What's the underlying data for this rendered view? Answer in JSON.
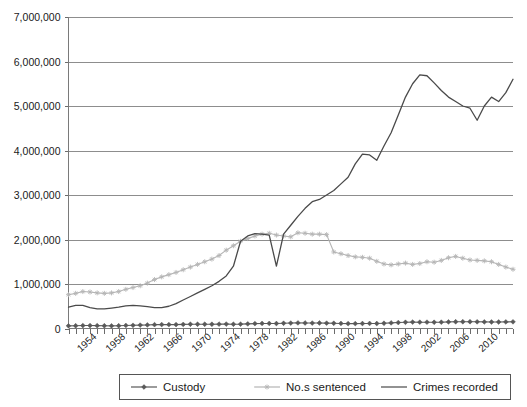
{
  "chart_data": {
    "type": "line",
    "title": "",
    "subtitle": "",
    "xlabel": "",
    "ylabel": "",
    "ylim": [
      0,
      7000000
    ],
    "xlim": [
      1950,
      2012
    ],
    "grid": true,
    "legend_position": "bottom",
    "y_ticks": [
      0,
      1000000,
      2000000,
      3000000,
      4000000,
      5000000,
      6000000,
      7000000
    ],
    "y_tick_labels": [
      "0",
      "1,000,000",
      "2,000,000",
      "3,000,000",
      "4,000,000",
      "5,000,000",
      "6,000,000",
      "7,000,000"
    ],
    "x_tick_labels": [
      "1954",
      "1958",
      "1962",
      "1966",
      "1970",
      "1974",
      "1978",
      "1982",
      "1986",
      "1990",
      "1994",
      "1998",
      "2002",
      "2006",
      "2010"
    ],
    "x_tick_values": [
      1954,
      1958,
      1962,
      1966,
      1970,
      1974,
      1978,
      1982,
      1986,
      1990,
      1994,
      1998,
      2002,
      2006,
      2010
    ],
    "x_minor_step": 1,
    "x": [
      1950,
      1951,
      1952,
      1953,
      1954,
      1955,
      1956,
      1957,
      1958,
      1959,
      1960,
      1961,
      1962,
      1963,
      1964,
      1965,
      1966,
      1967,
      1968,
      1969,
      1970,
      1971,
      1972,
      1973,
      1974,
      1975,
      1976,
      1977,
      1978,
      1979,
      1980,
      1981,
      1982,
      1983,
      1984,
      1985,
      1986,
      1987,
      1988,
      1989,
      1990,
      1991,
      1992,
      1993,
      1994,
      1995,
      1996,
      1997,
      1998,
      1999,
      2000,
      2001,
      2002,
      2003,
      2004,
      2005,
      2006,
      2007,
      2008,
      2009,
      2010,
      2011,
      2012
    ],
    "series": [
      {
        "name": "Custody",
        "color": "#595959",
        "marker": "diamond",
        "values": [
          60000,
          62000,
          66000,
          66000,
          64000,
          62000,
          60000,
          62000,
          68000,
          72000,
          76000,
          80000,
          86000,
          88000,
          88000,
          88000,
          92000,
          96000,
          96000,
          96000,
          96000,
          98000,
          100000,
          96000,
          98000,
          104000,
          110000,
          114000,
          114000,
          112000,
          118000,
          122000,
          126000,
          124000,
          122000,
          124000,
          120000,
          118000,
          114000,
          110000,
          110000,
          112000,
          114000,
          112000,
          118000,
          126000,
          134000,
          140000,
          144000,
          142000,
          142000,
          140000,
          142000,
          148000,
          152000,
          152000,
          152000,
          150000,
          148000,
          146000,
          146000,
          148000,
          150000
        ]
      },
      {
        "name": "No.s sentenced",
        "color": "#b5b5b5",
        "marker": "asterisk",
        "values": [
          760000,
          790000,
          830000,
          820000,
          800000,
          790000,
          800000,
          830000,
          880000,
          920000,
          960000,
          1020000,
          1100000,
          1160000,
          1210000,
          1260000,
          1320000,
          1380000,
          1440000,
          1500000,
          1560000,
          1640000,
          1760000,
          1860000,
          1960000,
          2020000,
          2080000,
          2120000,
          2140000,
          2100000,
          2080000,
          2060000,
          2150000,
          2140000,
          2120000,
          2120000,
          2110000,
          1720000,
          1680000,
          1640000,
          1610000,
          1600000,
          1580000,
          1510000,
          1450000,
          1430000,
          1450000,
          1470000,
          1440000,
          1460000,
          1500000,
          1490000,
          1530000,
          1590000,
          1620000,
          1580000,
          1540000,
          1530000,
          1520000,
          1500000,
          1440000,
          1380000,
          1330000
        ]
      },
      {
        "name": "Crimes recorded",
        "color": "#4a4a4a",
        "marker": "none",
        "values": [
          480000,
          520000,
          520000,
          480000,
          440000,
          440000,
          460000,
          480000,
          500000,
          520000,
          520000,
          500000,
          480000,
          480000,
          500000,
          540000,
          600000,
          660000,
          720000,
          780000,
          840000,
          920000,
          1000000,
          1100000,
          1200000,
          1300000,
          1380000,
          1420000,
          1400000,
          1350000,
          1380000,
          1400000,
          1450000,
          1500000,
          1550000,
          1570000,
          1500000,
          1380000,
          1350000,
          1250000,
          1180000,
          1080000,
          1000000,
          980000,
          1000000,
          1100000,
          1220000,
          1400000,
          1600000,
          1800000,
          1900000,
          2000000,
          2050000,
          2100000,
          2150000,
          2100000,
          2100000,
          2150000,
          2200000,
          2300000,
          2500000,
          2550000,
          2600000
        ]
      }
    ],
    "crimes_recorded_actual": {
      "note": "Crimes recorded values read from plot",
      "x": [
        1950,
        1951,
        1952,
        1953,
        1954,
        1955,
        1956,
        1957,
        1958,
        1959,
        1960,
        1961,
        1962,
        1963,
        1964,
        1965,
        1966,
        1967,
        1968,
        1969,
        1970,
        1971,
        1972,
        1973,
        1974,
        1975,
        1976,
        1977,
        1978,
        1979,
        1980,
        1981,
        1982,
        1983,
        1984,
        1985,
        1986,
        1987,
        1988,
        1989,
        1990,
        1991,
        1992,
        1993,
        1994,
        1995,
        1996,
        1997,
        1998,
        1999,
        2000,
        2001,
        2002,
        2003,
        2004,
        2005,
        2006,
        2007,
        2008,
        2009,
        2010,
        2011,
        2012
      ],
      "values": [
        480000,
        520000,
        520000,
        470000,
        440000,
        440000,
        460000,
        480000,
        510000,
        520000,
        510000,
        490000,
        470000,
        470000,
        500000,
        560000,
        640000,
        720000,
        800000,
        880000,
        960000,
        1060000,
        1180000,
        1400000,
        1960000,
        2080000,
        2130000,
        2120000,
        2100000,
        1400000,
        2120000,
        2320000,
        2520000,
        2700000,
        2850000,
        2900000,
        3000000,
        3100000,
        3250000,
        3400000,
        3700000,
        3920000,
        3900000,
        3780000,
        4100000,
        4400000,
        4800000,
        5200000,
        5500000,
        5700000,
        5680000,
        5520000,
        5350000,
        5200000,
        5100000,
        5000000,
        4950000,
        4680000,
        5000000,
        5200000,
        5100000,
        5300000,
        5600000,
        5800000,
        6050000,
        6100000,
        5900000,
        5750000,
        5600000,
        5500000,
        5200000,
        4900000,
        4600000,
        4400000,
        4250000,
        4100000,
        3980000,
        3930000,
        3900000
      ]
    }
  },
  "legend": {
    "items": [
      {
        "label": "Custody",
        "color": "#595959",
        "marker": "diamond"
      },
      {
        "label": "No.s sentenced",
        "color": "#b5b5b5",
        "marker": "asterisk"
      },
      {
        "label": "Crimes recorded",
        "color": "#4a4a4a",
        "marker": "none"
      }
    ]
  },
  "colors": {
    "grid": "#8d8d8d",
    "axis": "#7a7a7a",
    "background": "#ffffff",
    "text": "#1a1a1a"
  }
}
